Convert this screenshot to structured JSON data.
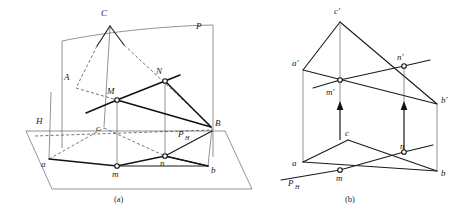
{
  "figure": {
    "captions": {
      "a": "(a)",
      "b": "(b)"
    },
    "colors": {
      "ink": "#111111",
      "thin_ink": "#4a4a4a",
      "dashed_ink": "#3a3a3a",
      "node_fill": "#ffffff",
      "background": "#ffffff"
    },
    "panel_a": {
      "name": "pictorial-view",
      "labels": {
        "plane_p": "P",
        "plane_h": "H",
        "trace_ph": "P",
        "trace_ph_sub": "H",
        "vertex_c_upper": "C",
        "vertex_a_upper": "A",
        "vertex_b_upper": "B",
        "point_m_upper": "M",
        "point_n_upper": "N",
        "vertex_a_lower": "a",
        "vertex_b_lower": "b",
        "vertex_c_lower": "c",
        "point_m_lower": "m",
        "point_n_lower": "n"
      },
      "label_positions": {
        "plane_p": [
          196,
          29
        ],
        "plane_h": [
          38,
          121
        ],
        "trace_ph": [
          181,
          134
        ],
        "vertex_c_upper": [
          101,
          15
        ],
        "vertex_a_upper": [
          67,
          79
        ],
        "vertex_b_upper": [
          218,
          124
        ],
        "point_m_upper": [
          110,
          92
        ],
        "point_n_upper": [
          158,
          72
        ],
        "vertex_a_lower": [
          42,
          164
        ],
        "vertex_b_lower": [
          213,
          170
        ],
        "vertex_c_lower": [
          97,
          129
        ],
        "point_m_lower": [
          113,
          172
        ],
        "point_n_lower": [
          160,
          163
        ]
      }
    },
    "panel_b": {
      "name": "orthographic-view",
      "labels": {
        "trace_ph": "P",
        "trace_ph_sub": "H",
        "vertex_c_front": "c'",
        "vertex_a_front": "a'",
        "vertex_b_front": "b'",
        "point_m_front": "m'",
        "point_n_front": "n'",
        "vertex_a_top": "a",
        "vertex_b_top": "b",
        "vertex_c_top": "c",
        "point_m_top": "m",
        "point_n_top": "n"
      },
      "label_positions": {
        "vertex_c_front": [
          333,
          13
        ],
        "vertex_a_front": [
          296,
          63
        ],
        "vertex_b_front": [
          443,
          97
        ],
        "point_m_front": [
          326,
          93
        ],
        "point_n_front": [
          394,
          60
        ],
        "vertex_a_top": [
          292,
          157
        ],
        "vertex_b_top": [
          441,
          176
        ],
        "vertex_c_top": [
          353,
          133
        ],
        "point_m_top": [
          337,
          177
        ],
        "point_n_top": [
          402,
          146
        ],
        "trace_ph": [
          277,
          176
        ]
      }
    },
    "geometry_notes": {
      "panel_a_points": {
        "C_upper": [
          110,
          25
        ],
        "A_upper": [
          75,
          88
        ],
        "B_upper": [
          212,
          127
        ],
        "M_upper": [
          117,
          100
        ],
        "N_upper": [
          165,
          80
        ],
        "a_lower": [
          49,
          159
        ],
        "b_lower": [
          208,
          166
        ],
        "c_lower": [
          104,
          127
        ],
        "m_lower": [
          117,
          166
        ],
        "n_lower": [
          165,
          156
        ]
      },
      "panel_b_points": {
        "c_front": [
          340,
          22
        ],
        "a_front": [
          303,
          70
        ],
        "b_front": [
          437,
          104
        ],
        "m_front": [
          340,
          80
        ],
        "n_front": [
          404,
          66
        ],
        "a_top": [
          303,
          162
        ],
        "b_top": [
          437,
          171
        ],
        "c_top": [
          348,
          140
        ],
        "m_top": [
          340,
          170
        ],
        "n_top": [
          404,
          152
        ]
      }
    }
  }
}
